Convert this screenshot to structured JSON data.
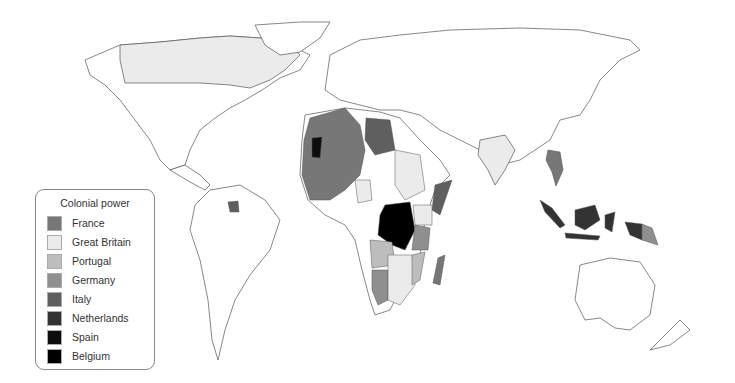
{
  "map": {
    "title": "Colonial powers",
    "projection": "world",
    "background_color": "#ffffff",
    "border_color": "#555555"
  },
  "legend": {
    "title": "Colonial power",
    "items": [
      {
        "label": "France",
        "color": "#777777"
      },
      {
        "label": "Great Britain",
        "color": "#ebebeb"
      },
      {
        "label": "Portugal",
        "color": "#bdbdbd"
      },
      {
        "label": "Germany",
        "color": "#8f8f8f"
      },
      {
        "label": "Italy",
        "color": "#5f5f5f"
      },
      {
        "label": "Netherlands",
        "color": "#333333"
      },
      {
        "label": "Spain",
        "color": "#0d0d0d"
      },
      {
        "label": "Belgium",
        "color": "#000000"
      }
    ]
  }
}
